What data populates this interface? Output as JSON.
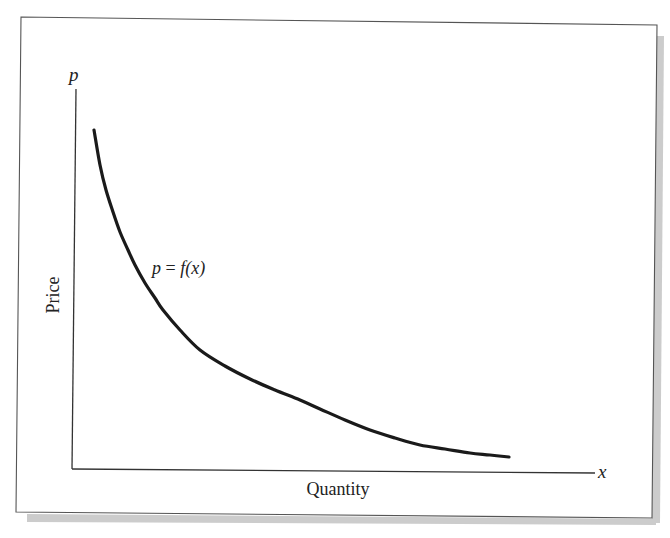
{
  "colors": {
    "background": "#ffffff",
    "frame_stroke": "#555555",
    "shadow": "#c8c8c8",
    "axis_stroke": "#333333",
    "curve_stroke": "#1a1a1a",
    "text": "#222222"
  },
  "labels": {
    "y_axis_symbol": "p",
    "x_axis_symbol": "x",
    "y_axis_title": "Price",
    "x_axis_title": "Quantity",
    "curve_label_lhs": "p",
    "curve_label_eq": " = ",
    "curve_label_rhs": "f(x)"
  },
  "chart_data": {
    "type": "line",
    "title": "",
    "xlabel": "Quantity",
    "ylabel": "Price",
    "x_axis_symbol": "x",
    "y_axis_symbol": "p",
    "grid": false,
    "legend": null,
    "ticks": "none",
    "annotations": [
      {
        "text": "p = f(x)",
        "position": "left of curve, upper-middle"
      }
    ],
    "series": [
      {
        "name": "p = f(x)",
        "note": "Digitized in pixel coordinates of the 670x538 image (origin of axes at approx (72,469)); y increases downward in pixel space.",
        "points_px": [
          [
            94,
            130
          ],
          [
            100,
            165
          ],
          [
            106,
            190
          ],
          [
            113,
            212
          ],
          [
            120,
            232
          ],
          [
            128,
            250
          ],
          [
            135,
            265
          ],
          [
            145,
            283
          ],
          [
            155,
            298
          ],
          [
            163,
            310
          ],
          [
            180,
            330
          ],
          [
            200,
            350
          ],
          [
            225,
            366
          ],
          [
            250,
            379
          ],
          [
            275,
            390
          ],
          [
            300,
            400
          ],
          [
            320,
            409
          ],
          [
            345,
            420
          ],
          [
            370,
            430
          ],
          [
            395,
            438
          ],
          [
            420,
            445
          ],
          [
            445,
            449
          ],
          [
            470,
            453
          ],
          [
            490,
            455
          ],
          [
            509,
            457
          ]
        ]
      }
    ],
    "axes_px": {
      "origin": [
        72,
        469
      ],
      "y_axis_top": [
        76,
        89
      ],
      "x_axis_end": [
        595,
        473
      ]
    }
  }
}
